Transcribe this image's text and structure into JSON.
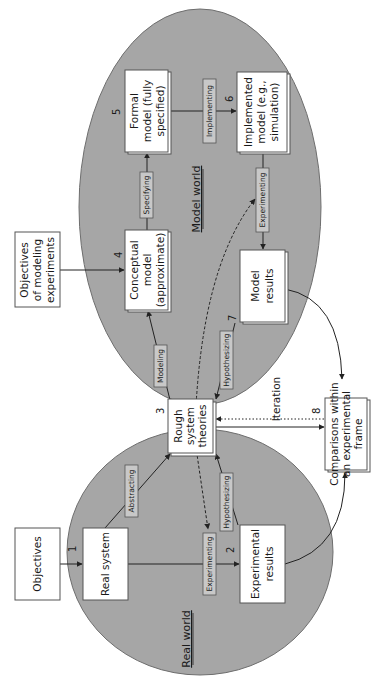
{
  "diagram": {
    "type": "modeling-process-flowchart",
    "orientation": "rotated-90-counterclockwise",
    "colors": {
      "world_fill": "#a6a6a6",
      "world_stroke": "#6e6e6e",
      "box_fill": "#ffffff",
      "box_stroke": "#555555",
      "tag_fill": "#c8c8c8",
      "line": "#333333"
    },
    "regions": {
      "real_world": {
        "label": "Real world"
      },
      "model_world": {
        "label": "Model world"
      }
    },
    "nodes": {
      "objectives": {
        "label_lines": [
          "Objectives"
        ]
      },
      "real_system": {
        "label_lines": [
          "Real system"
        ],
        "number": "1"
      },
      "experimental_results": {
        "label_lines": [
          "Experimental",
          "results"
        ],
        "number": "2"
      },
      "rough_theories": {
        "label_lines": [
          "Rough",
          "system",
          "theories"
        ],
        "number": "3"
      },
      "objectives_modeling": {
        "label_lines": [
          "Objectives",
          "of modeling",
          "experiments"
        ]
      },
      "conceptual_model": {
        "label_lines": [
          "Conceptual",
          "model",
          "(approximate)"
        ],
        "number": "4"
      },
      "formal_model": {
        "label_lines": [
          "Formal",
          "model (fully",
          "specified)"
        ],
        "number": "5"
      },
      "implemented_model": {
        "label_lines": [
          "Implemented",
          "model (e.g.,",
          "simulation)"
        ],
        "number": "6"
      },
      "model_results": {
        "label_lines": [
          "Model",
          "results"
        ],
        "number": "7"
      },
      "comparisons": {
        "label_lines": [
          "Comparisons within",
          "an experimental",
          "frame"
        ],
        "number": "8"
      }
    },
    "edge_labels": {
      "abstracting": "Abstracting",
      "experimenting_real": "Experimenting",
      "hypothesizing_real": "Hypothesizing",
      "modeling": "Modeling",
      "specifying": "Specifying",
      "implementing": "Implementing",
      "experimenting_model": "Experimenting",
      "hypothesizing_model": "Hypothesizing",
      "iteration": "Iteration"
    }
  }
}
